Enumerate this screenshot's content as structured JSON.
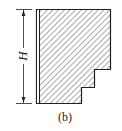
{
  "figure": {
    "dimension_label": "H",
    "caption": "(b)",
    "colors": {
      "stroke": "#222222",
      "hatch": "#444444",
      "background": "#ffffff"
    }
  }
}
